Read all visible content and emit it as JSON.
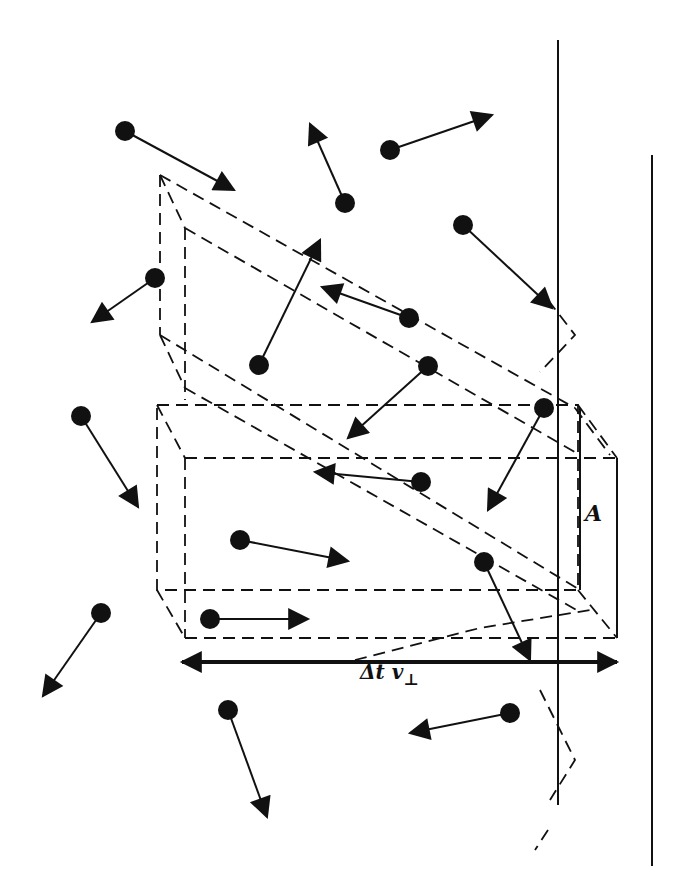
{
  "diagram": {
    "labels": {
      "area": "A",
      "length_main": "Δt v",
      "length_sub": "⊥"
    },
    "colors": {
      "ink": "#111111",
      "background": "#ffffff"
    },
    "walls": [
      {
        "name": "wall-front",
        "x": 558,
        "y1": 40,
        "y2": 805
      },
      {
        "name": "wall-back",
        "x": 652,
        "y1": 155,
        "y2": 866
      }
    ],
    "molecules": [
      {
        "x": 125,
        "y": 131,
        "tx": 234,
        "ty": 190
      },
      {
        "x": 345,
        "y": 203,
        "tx": 310,
        "ty": 124
      },
      {
        "x": 390,
        "y": 150,
        "tx": 492,
        "ty": 115
      },
      {
        "x": 463,
        "y": 225,
        "tx": 552,
        "ty": 308
      },
      {
        "x": 155,
        "y": 278,
        "tx": 92,
        "ty": 322
      },
      {
        "x": 259,
        "y": 365,
        "tx": 320,
        "ty": 240
      },
      {
        "x": 409,
        "y": 318,
        "tx": 322,
        "ty": 287
      },
      {
        "x": 428,
        "y": 366,
        "tx": 348,
        "ty": 438
      },
      {
        "x": 544,
        "y": 408,
        "tx": 488,
        "ty": 510
      },
      {
        "x": 81,
        "y": 416,
        "tx": 138,
        "ty": 507
      },
      {
        "x": 421,
        "y": 482,
        "tx": 315,
        "ty": 472
      },
      {
        "x": 240,
        "y": 540,
        "tx": 348,
        "ty": 561
      },
      {
        "x": 484,
        "y": 562,
        "tx": 530,
        "ty": 660
      },
      {
        "x": 210,
        "y": 619,
        "tx": 308,
        "ty": 619
      },
      {
        "x": 101,
        "y": 613,
        "tx": 43,
        "ty": 696
      },
      {
        "x": 228,
        "y": 710,
        "tx": 267,
        "ty": 817
      },
      {
        "x": 510,
        "y": 713,
        "tx": 410,
        "ty": 733
      }
    ],
    "dimension_arrow": {
      "x1": 182,
      "x2": 617,
      "y": 662
    }
  }
}
